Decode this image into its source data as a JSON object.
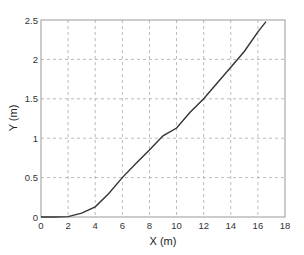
{
  "chart_data": {
    "type": "line",
    "title": "",
    "xlabel": "X (m)",
    "ylabel": "Y (m)",
    "xlim": [
      0,
      18
    ],
    "ylim": [
      0,
      2.5
    ],
    "grid": true,
    "xticks": [
      "0",
      "2",
      "4",
      "6",
      "8",
      "10",
      "12",
      "14",
      "16",
      "18"
    ],
    "yticks": [
      "0",
      "0.5",
      "1",
      "1.5",
      "2",
      "2.5"
    ],
    "series": [
      {
        "name": "trajectory",
        "x": [
          0,
          1,
          2,
          3,
          4,
          5,
          6,
          7,
          8,
          9,
          10,
          11,
          12,
          13,
          14,
          15,
          16,
          16.6
        ],
        "y": [
          0,
          0,
          0.005,
          0.05,
          0.13,
          0.3,
          0.5,
          0.68,
          0.85,
          1.03,
          1.13,
          1.33,
          1.5,
          1.7,
          1.9,
          2.1,
          2.35,
          2.48
        ]
      }
    ]
  }
}
